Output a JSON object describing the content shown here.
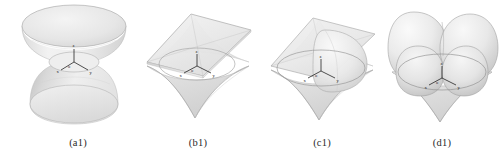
{
  "figure": {
    "background_color": "#ffffff",
    "panel_count": 4,
    "surface_fill": "#e9e9e9",
    "surface_shadow": "#cfcfcf",
    "surface_highlight": "#f7f7f7",
    "wire_color": "#9a9a9a",
    "axis_color": "#1a1a1a",
    "caption_color": "#2b2b2b"
  },
  "panels": [
    {
      "id": "a1",
      "caption": "(a1)",
      "surface_name": "hyperboloid-of-one-sheet",
      "axis_labels": {
        "z": "z",
        "x": "x",
        "y": "y",
        "origin": "o"
      }
    },
    {
      "id": "b1",
      "caption": "(b1)",
      "surface_name": "astroidal-double-cone",
      "axis_labels": {
        "z": "z",
        "x": "x",
        "y": "y",
        "origin": "o"
      }
    },
    {
      "id": "c1",
      "caption": "(c1)",
      "surface_name": "astroidal-cone-with-lobe",
      "axis_labels": {
        "z": "z",
        "x": "x",
        "y": "y",
        "origin": "o"
      }
    },
    {
      "id": "d1",
      "caption": "(d1)",
      "surface_name": "double-lobed-superquadric",
      "axis_labels": {
        "z": "z",
        "x": "x",
        "y": "y",
        "origin": "o"
      }
    }
  ]
}
